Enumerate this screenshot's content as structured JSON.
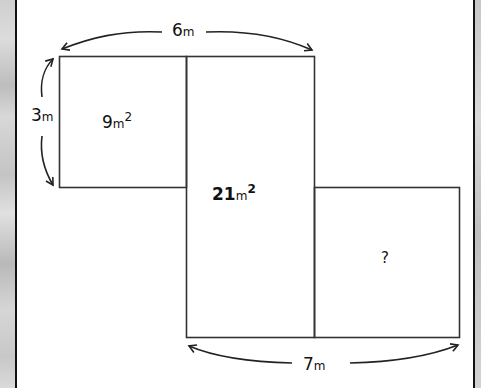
{
  "diagram": {
    "type": "area-puzzle",
    "shapes": [
      {
        "id": "rect-left",
        "area_label": "9",
        "unit": "m",
        "exponent": "2"
      },
      {
        "id": "rect-middle",
        "area_label": "21",
        "unit": "m",
        "exponent": "2"
      },
      {
        "id": "rect-right",
        "area_label": "?"
      }
    ],
    "dimensions": {
      "top_width": {
        "value": "6",
        "unit": "m"
      },
      "left_height": {
        "value": "3",
        "unit": "m"
      },
      "bottom_width": {
        "value": "7",
        "unit": "m"
      }
    },
    "colors": {
      "line": "#333333",
      "text": "#111111",
      "background": "#ffffff",
      "frame": "#111111"
    }
  }
}
